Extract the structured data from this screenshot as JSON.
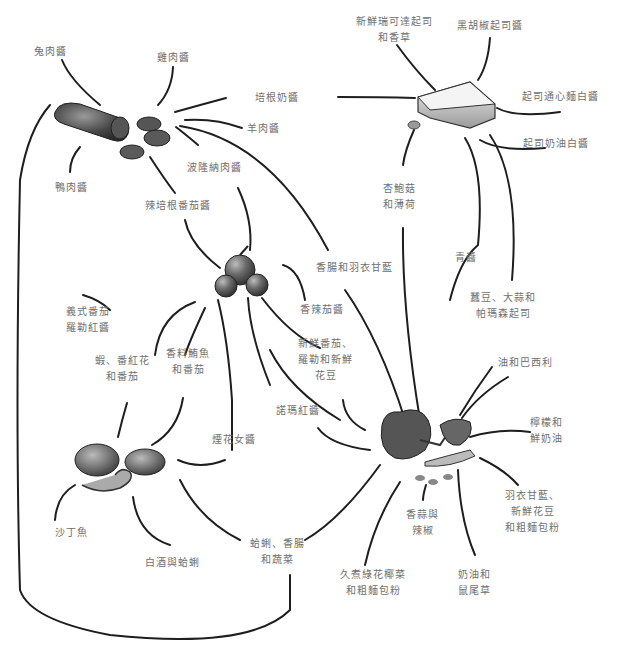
{
  "diagram": {
    "type": "ingredient-pairing-map",
    "hubs": [
      {
        "id": "salami",
        "name": "salami-sausage"
      },
      {
        "id": "cheese",
        "name": "cheese-wedge"
      },
      {
        "id": "tomato",
        "name": "tomato-cluster"
      },
      {
        "id": "broccoli",
        "name": "broccoli-and-peas"
      },
      {
        "id": "seafood",
        "name": "clams-and-shrimp"
      }
    ],
    "labels": {
      "rabbit_sauce": [
        "兔肉醬"
      ],
      "chicken_sauce": [
        "雞肉醬"
      ],
      "bacon_cream": [
        "培根奶醬"
      ],
      "lamb_sauce": [
        "羊肉醬"
      ],
      "duck_sauce": [
        "鴨肉醬"
      ],
      "bolognese": [
        "波隆納肉醬"
      ],
      "spicy_bacon_tomato": [
        "辣培根番茄醬"
      ],
      "ricotta_herbs": [
        "新鮮瑞可達起司",
        "和香草"
      ],
      "black_pepper_cheese": [
        "黑胡椒起司醬"
      ],
      "mac_cheese": [
        "起司通心麵白醬"
      ],
      "cheese_cream_white": [
        "起司奶油白醬"
      ],
      "mushroom_mint": [
        "杏鮑菇",
        "和薄荷"
      ],
      "pesto": [
        "青醬"
      ],
      "peas_garlic_parmesan": [
        "蠶豆、大蒜和",
        "帕瑪森起司"
      ],
      "sausage_kale": [
        "香腸和羽衣甘藍"
      ],
      "arrabbiata": [
        "香辣茄醬"
      ],
      "fresh_tomato_basil_peas": [
        "新鮮番茄、",
        "羅勒和新鮮",
        "花豆"
      ],
      "italian_tomato_basil": [
        "義式番茄",
        "羅勒紅醬"
      ],
      "shrimp_saffron": [
        "蝦、番紅花",
        "和番茄"
      ],
      "spiced_tuna": [
        "香料鮪魚",
        "和番茄"
      ],
      "norma": [
        "諾瑪紅醬"
      ],
      "puttanesca": [
        "煙花女醬"
      ],
      "oil_parsley": [
        "油和巴西利"
      ],
      "lemon_cream": [
        "檸檬和",
        "鮮奶油"
      ],
      "kale_peas_breadcrumb": [
        "羽衣甘藍、",
        "新鮮花豆",
        "和粗麵包粉"
      ],
      "garlic_chili": [
        "香蒜與",
        "辣椒"
      ],
      "butter_sage": [
        "奶油和",
        "鼠尾草"
      ],
      "stewed_broccoli_breadcrumb": [
        "久煮綠花椰菜",
        "和粗麵包粉"
      ],
      "sardine": [
        "沙丁魚"
      ],
      "white_wine_clams": [
        "白酒與蛤蜊"
      ],
      "clams_sausage_veg": [
        "蛤蜊、香腸",
        "和蔬菜"
      ]
    },
    "colors": {
      "line": "#1e1e1e",
      "label": "#707070",
      "background": "#ffffff"
    }
  }
}
